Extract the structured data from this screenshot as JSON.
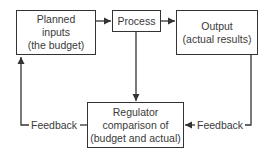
{
  "diagram": {
    "nodes": {
      "planned": {
        "lines": [
          "Planned",
          "inputs",
          "(the budget)"
        ]
      },
      "process": {
        "lines": [
          "Process"
        ]
      },
      "output": {
        "lines": [
          "Output",
          "(actual results)"
        ]
      },
      "regulator": {
        "lines": [
          "Regulator",
          "comparison of",
          "(budget and actual)"
        ]
      }
    },
    "edges": [
      {
        "from": "planned",
        "to": "process"
      },
      {
        "from": "process",
        "to": "output"
      },
      {
        "from": "process",
        "to": "regulator"
      },
      {
        "from": "output",
        "to": "regulator",
        "label": "Feedback"
      },
      {
        "from": "regulator",
        "to": "planned",
        "label": "Feedback"
      }
    ],
    "labels": {
      "feedback_left": "Feedback",
      "feedback_right": "Feedback"
    }
  }
}
